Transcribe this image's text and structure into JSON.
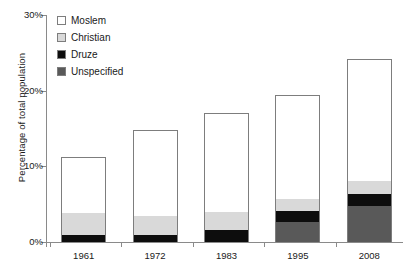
{
  "chart_data": {
    "type": "bar",
    "stacked": true,
    "title": "",
    "xlabel": "",
    "ylabel": "Percentage of total population",
    "categories": [
      "1961",
      "1972",
      "1983",
      "1995",
      "2008"
    ],
    "ylim": [
      0,
      30
    ],
    "yticks": [
      0,
      10,
      20,
      30
    ],
    "ytick_labels": [
      "0%",
      "10%",
      "20%",
      "30%"
    ],
    "grid": false,
    "legend_position": "top-left",
    "series": [
      {
        "name": "Unspecified",
        "color": "#595959",
        "values": [
          0.0,
          0.0,
          0.0,
          2.6,
          4.7
        ]
      },
      {
        "name": "Druze",
        "color": "#0d0d0d",
        "values": [
          0.9,
          0.9,
          1.6,
          1.5,
          1.6
        ]
      },
      {
        "name": "Christian",
        "color": "#d9d9d9",
        "values": [
          2.9,
          2.6,
          2.4,
          1.6,
          1.7
        ]
      },
      {
        "name": "Moslem",
        "color": "#ffffff",
        "values": [
          7.4,
          11.3,
          13.1,
          13.7,
          16.2
        ]
      }
    ],
    "totals": [
      11.2,
      14.8,
      17.1,
      19.4,
      24.2
    ]
  },
  "legend": {
    "items": [
      {
        "label": "Moslem",
        "color": "#ffffff"
      },
      {
        "label": "Christian",
        "color": "#d9d9d9"
      },
      {
        "label": "Druze",
        "color": "#0d0d0d"
      },
      {
        "label": "Unspecified",
        "color": "#595959"
      }
    ]
  },
  "axis": {
    "y_title": "Percentage of total population",
    "y_labels": [
      "30%",
      "20%",
      "10%",
      "0%"
    ],
    "x_labels": [
      "1961",
      "1972",
      "1983",
      "1995",
      "2008"
    ]
  }
}
